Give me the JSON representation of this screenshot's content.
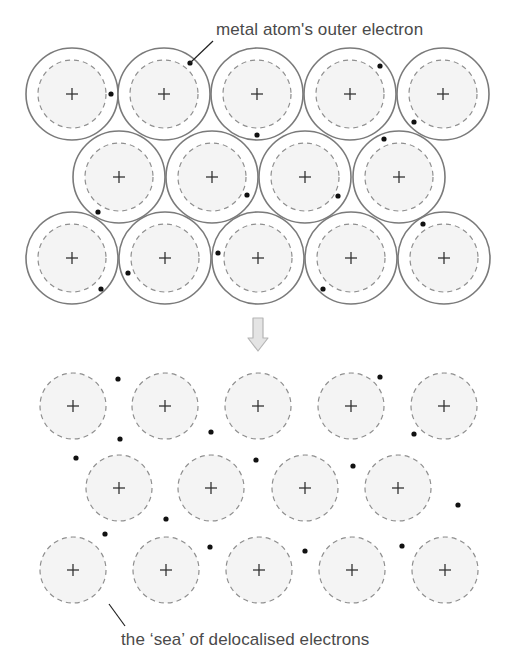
{
  "diagram": {
    "top_label": "metal atom's outer electron",
    "bottom_label": "the ‘sea’ of delocalised electrons",
    "arrow": "down-arrow",
    "colors": {
      "outer_circle": "#7a7a7a",
      "dashed_circle": "#8f8f8f",
      "ion_fill": "#f4f4f4",
      "electron": "#111111",
      "plus": "#333333",
      "text": "#4a4a4a",
      "arrow_fill": "#e4e4e4",
      "arrow_stroke": "#b5b5b5"
    },
    "top_lattice": {
      "description": "Metal atoms with outer shell and one outer electron each",
      "outer_radius": 46,
      "inner_radius": 34,
      "atoms": [
        {
          "x": 72,
          "y": 94
        },
        {
          "x": 164,
          "y": 94
        },
        {
          "x": 257,
          "y": 94
        },
        {
          "x": 350,
          "y": 94
        },
        {
          "x": 443,
          "y": 94
        },
        {
          "x": 119,
          "y": 177
        },
        {
          "x": 212,
          "y": 177
        },
        {
          "x": 305,
          "y": 177
        },
        {
          "x": 399,
          "y": 177
        },
        {
          "x": 72,
          "y": 258
        },
        {
          "x": 165,
          "y": 258
        },
        {
          "x": 258,
          "y": 258
        },
        {
          "x": 351,
          "y": 258
        },
        {
          "x": 444,
          "y": 258
        }
      ],
      "electrons": [
        {
          "x": 111,
          "y": 94
        },
        {
          "x": 190,
          "y": 63
        },
        {
          "x": 380,
          "y": 66
        },
        {
          "x": 257,
          "y": 135
        },
        {
          "x": 414,
          "y": 122
        },
        {
          "x": 98,
          "y": 212
        },
        {
          "x": 247,
          "y": 195
        },
        {
          "x": 338,
          "y": 196
        },
        {
          "x": 384,
          "y": 139
        },
        {
          "x": 101,
          "y": 289
        },
        {
          "x": 128,
          "y": 273
        },
        {
          "x": 218,
          "y": 253
        },
        {
          "x": 323,
          "y": 289
        },
        {
          "x": 423,
          "y": 224
        }
      ],
      "pointer": {
        "x1": 213,
        "y1": 41,
        "x2": 190,
        "y2": 63
      }
    },
    "bottom_lattice": {
      "description": "Positive metal ions in a sea of delocalised electrons",
      "ion_radius": 33,
      "ions": [
        {
          "x": 73,
          "y": 406
        },
        {
          "x": 165,
          "y": 406
        },
        {
          "x": 258,
          "y": 406
        },
        {
          "x": 351,
          "y": 406
        },
        {
          "x": 444,
          "y": 406
        },
        {
          "x": 119,
          "y": 488
        },
        {
          "x": 211,
          "y": 488
        },
        {
          "x": 305,
          "y": 488
        },
        {
          "x": 398,
          "y": 488
        },
        {
          "x": 73,
          "y": 570
        },
        {
          "x": 166,
          "y": 570
        },
        {
          "x": 259,
          "y": 570
        },
        {
          "x": 352,
          "y": 570
        },
        {
          "x": 445,
          "y": 570
        }
      ],
      "electrons": [
        {
          "x": 118,
          "y": 379
        },
        {
          "x": 120,
          "y": 439
        },
        {
          "x": 76,
          "y": 458
        },
        {
          "x": 211,
          "y": 432
        },
        {
          "x": 256,
          "y": 460
        },
        {
          "x": 380,
          "y": 377
        },
        {
          "x": 414,
          "y": 434
        },
        {
          "x": 353,
          "y": 466
        },
        {
          "x": 166,
          "y": 519
        },
        {
          "x": 105,
          "y": 534
        },
        {
          "x": 210,
          "y": 547
        },
        {
          "x": 305,
          "y": 551
        },
        {
          "x": 402,
          "y": 546
        },
        {
          "x": 458,
          "y": 505
        }
      ],
      "pointer": {
        "x1": 109,
        "y1": 604,
        "x2": 125,
        "y2": 626
      }
    }
  }
}
